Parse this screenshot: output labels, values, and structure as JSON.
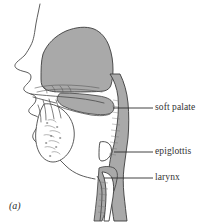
{
  "figure": {
    "caption": "(a)",
    "type": "mid-sagittal section of the human vocal tract",
    "background_color": "#ffffff",
    "shading_color": "#a9a9a9",
    "outline_color": "#3a3a3a",
    "leader_color": "#2e2e2e",
    "text_color": "#333333"
  },
  "labels": [
    {
      "id": "soft-palate",
      "text": "soft palate",
      "leader": {
        "x1": 113,
        "y1": 108,
        "x2": 153,
        "y2": 108
      }
    },
    {
      "id": "epiglottis",
      "text": "epiglottis",
      "leader": {
        "x1": 114,
        "y1": 152,
        "x2": 153,
        "y2": 152
      }
    },
    {
      "id": "larynx",
      "text": "larynx",
      "leader": {
        "x1": 104,
        "y1": 178,
        "x2": 153,
        "y2": 178
      }
    }
  ],
  "anatomy_parts": [
    "nasal cavity",
    "hard palate",
    "soft palate",
    "tongue",
    "pharynx",
    "epiglottis",
    "larynx",
    "trachea",
    "lips",
    "jaw"
  ]
}
